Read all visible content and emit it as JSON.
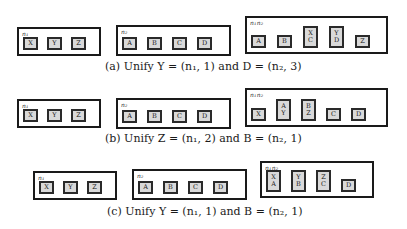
{
  "rows": [
    {
      "caption": "(a) Unify Y = (n₁, 1) and D = (n₂, 3)",
      "n1": {
        "label": "n1",
        "cells": [
          [
            "X"
          ],
          [
            "Y"
          ],
          [
            "Z"
          ]
        ]
      },
      "n2": {
        "label": "n2",
        "cells": [
          [
            "A"
          ],
          [
            "B"
          ],
          [
            "C"
          ],
          [
            "D"
          ]
        ]
      },
      "merged": {
        "label": "n1n2",
        "cells": [
          [
            "A"
          ],
          [
            "B"
          ],
          [
            "X",
            "C"
          ],
          [
            "Y",
            "D"
          ],
          [
            "Z"
          ]
        ]
      }
    },
    {
      "caption": "(b) Unify Z = (n₁, 2) and B = (n₂, 1)",
      "n1": {
        "label": "n1",
        "cells": [
          [
            "X"
          ],
          [
            "Y"
          ],
          [
            "Z"
          ]
        ]
      },
      "n2": {
        "label": "n2",
        "cells": [
          [
            "A"
          ],
          [
            "B"
          ],
          [
            "C"
          ],
          [
            "D"
          ]
        ]
      },
      "merged": {
        "label": "n1n2",
        "cells": [
          [
            "X"
          ],
          [
            "A",
            "Y"
          ],
          [
            "B",
            "Z"
          ],
          [
            "C"
          ],
          [
            "D"
          ]
        ]
      }
    },
    {
      "caption": "(c) Unify Y = (n₁, 1) and B = (n₂, 1)",
      "n1": {
        "label": "n1",
        "cells": [
          [
            "X"
          ],
          [
            "Y"
          ],
          [
            "Z"
          ]
        ]
      },
      "n2": {
        "label": "n2",
        "cells": [
          [
            "A"
          ],
          [
            "B"
          ],
          [
            "C"
          ],
          [
            "D"
          ]
        ]
      },
      "merged": {
        "label": "n1n2",
        "cells": [
          [
            "X",
            "A"
          ],
          [
            "Y",
            "B"
          ],
          [
            "Z",
            "C"
          ],
          [
            "D"
          ]
        ]
      }
    }
  ],
  "labels": {
    "n1": "n₁",
    "n2": "n₂",
    "n1n2": "n₁n₂"
  }
}
